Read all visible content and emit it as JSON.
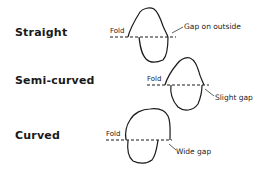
{
  "diagram": {
    "rows": [
      {
        "id": "straight",
        "label": "Straight",
        "fold_label": "Fold",
        "gap_label": "Gap on outside"
      },
      {
        "id": "semi-curved",
        "label": "Semi-curved",
        "fold_label": "Fold",
        "gap_label": "Slight gap"
      },
      {
        "id": "curved",
        "label": "Curved",
        "fold_label": "Fold",
        "gap_label": "Wide gap"
      }
    ],
    "colors": {
      "stroke": "#1a1a1a",
      "text": "#1a1a1a",
      "background": "#ffffff"
    }
  }
}
